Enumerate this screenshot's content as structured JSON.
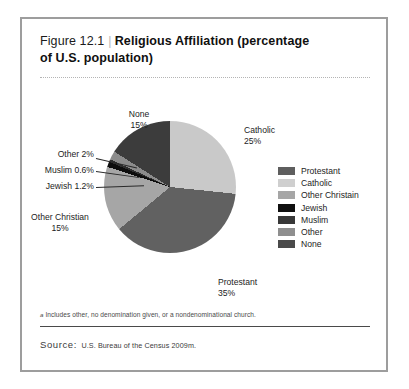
{
  "figure": {
    "number": "Figure 12.1",
    "separator": "|",
    "title": "Religious Affiliation (percentage of U.S. population)",
    "title_line1": "Religious Affiliation (percentage",
    "title_line2": "of U.S. population)"
  },
  "chart_data": {
    "type": "pie",
    "title": "Religious Affiliation (percentage of U.S. population)",
    "unit": "percent",
    "categories": [
      "Protestant",
      "Catholic",
      "Other Christian",
      "Jewish",
      "Muslim",
      "Other",
      "None"
    ],
    "values": [
      35,
      25,
      15,
      1.2,
      0.6,
      2,
      15
    ],
    "value_labels": [
      "35%",
      "25%",
      "15%",
      "1.2%",
      "0.6%",
      "2%",
      "15%"
    ],
    "colors": [
      "#616161",
      "#c9c9c9",
      "#a6a6a6",
      "#0d0d0d",
      "#2e2e2e",
      "#8c8c8c",
      "#3c3c3c"
    ],
    "legend_position": "right",
    "start_angle_deg": 0,
    "direction": "clockwise",
    "slices": [
      {
        "label": "Catholic",
        "value": 25,
        "value_label": "25%",
        "color": "#c9c9c9"
      },
      {
        "label": "Protestant",
        "value": 35,
        "value_label": "35%",
        "color": "#616161"
      },
      {
        "label": "Other Christian",
        "value": 15,
        "value_label": "15%",
        "color": "#a6a6a6"
      },
      {
        "label": "Jewish",
        "value": 1.2,
        "value_label": "1.2%",
        "color": "#0d0d0d"
      },
      {
        "label": "Muslim",
        "value": 0.6,
        "value_label": "0.6%",
        "color": "#2e2e2e"
      },
      {
        "label": "Other",
        "value": 2,
        "value_label": "2%",
        "color": "#8c8c8c"
      },
      {
        "label": "None",
        "value": 15,
        "value_label": "15%",
        "color": "#3c3c3c"
      }
    ]
  },
  "callouts": {
    "none": {
      "name": "None",
      "pct": "15%"
    },
    "other": {
      "name": "Other 2%"
    },
    "muslim": {
      "name": "Muslim 0.6%"
    },
    "jewish": {
      "name": "Jewish 1.2%"
    },
    "other_christian": {
      "name": "Other Christian",
      "pct": "15%"
    },
    "catholic": {
      "name": "Catholic",
      "pct": "25%"
    },
    "protestant": {
      "name": "Protestant",
      "pct": "35%"
    }
  },
  "legend": {
    "items": [
      {
        "label": "Protestant",
        "color": "#5e5e5e"
      },
      {
        "label": "Catholic",
        "color": "#cfcfcf"
      },
      {
        "label": "Other Christain",
        "color": "#a6a6a6"
      },
      {
        "label": "Jewish",
        "color": "#101010"
      },
      {
        "label": "Muslim",
        "color": "#383838"
      },
      {
        "label": "Other",
        "color": "#8f8f8f"
      },
      {
        "label": "None",
        "color": "#4a4a4a"
      }
    ]
  },
  "footnote": {
    "marker": "a",
    "text": "Includes other, no denomination given, or a nondenominational church."
  },
  "source": {
    "label": "Source:",
    "text": "U.S. Bureau of the Census 2009m."
  }
}
